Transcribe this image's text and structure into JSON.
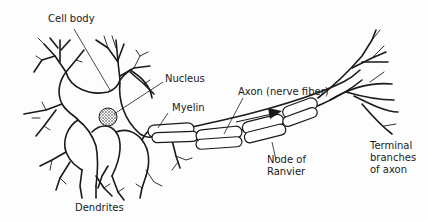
{
  "diagram": {
    "labels": {
      "cell_body": "Cell body",
      "nucleus": "Nucleus",
      "myelin": "Myelin",
      "axon": "Axon (nerve fiber)",
      "node_line1": "Node of",
      "node_line2": "Ranvier",
      "terminal_line1": "Terminal",
      "terminal_line2": "branches",
      "terminal_line3": "of axon",
      "dendrites": "Dendrites"
    },
    "colors": {
      "line": "#1a1a1a",
      "background": "#fdfdfd",
      "nucleus_fill": "#9a9a9a"
    },
    "arrow_direction": "right"
  }
}
